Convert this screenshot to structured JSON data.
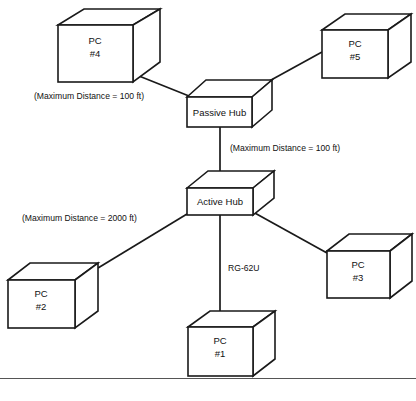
{
  "diagram": {
    "background_color": "#ffffff",
    "line_color": "#1a1a1a",
    "text_color": "#111111",
    "nodes": [
      {
        "id": "pc4",
        "line1": "PC",
        "line2": "#4",
        "shape": "cube"
      },
      {
        "id": "pc5",
        "line1": "PC",
        "line2": "#5",
        "shape": "cube"
      },
      {
        "id": "passive_hub",
        "line1": "Passive Hub",
        "line2": "",
        "shape": "slab"
      },
      {
        "id": "active_hub",
        "line1": "Active Hub",
        "line2": "",
        "shape": "slab"
      },
      {
        "id": "pc2",
        "line1": "PC",
        "line2": "#2",
        "shape": "cube"
      },
      {
        "id": "pc3",
        "line1": "PC",
        "line2": "#3",
        "shape": "cube"
      },
      {
        "id": "pc1",
        "line1": "PC",
        "line2": "#1",
        "shape": "cube"
      }
    ],
    "edge_labels": [
      {
        "id": "dist_pc4_passive",
        "text": "(Maximum Distance = 100 ft)"
      },
      {
        "id": "dist_passive_active",
        "text": "(Maximum Distance = 100 ft)"
      },
      {
        "id": "dist_pc2_active",
        "text": "(Maximum Distance = 2000 ft)"
      },
      {
        "id": "cable_rg62u",
        "text": "RG-62U"
      }
    ]
  }
}
